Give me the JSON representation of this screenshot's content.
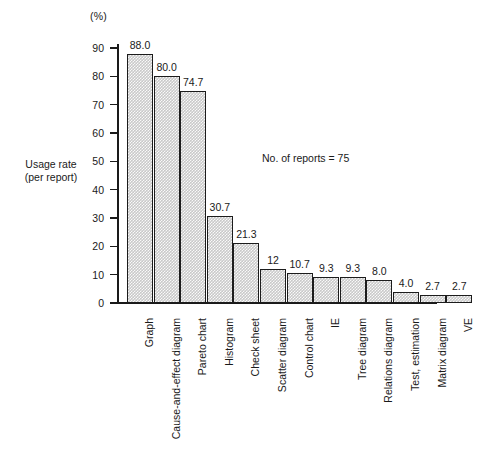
{
  "chart_data": {
    "type": "bar",
    "title": "",
    "subtitle": "",
    "xlabel": "",
    "ylabel": "Usage rate\n(per report)",
    "unit_label": "(%)",
    "annotation": "No. of reports = 75",
    "ylim": [
      0,
      90
    ],
    "ytick_values": [
      0,
      10,
      20,
      30,
      40,
      50,
      60,
      70,
      80,
      90
    ],
    "ytick_labels": [
      "0",
      "10",
      "20",
      "30",
      "40",
      "50",
      "60",
      "70",
      "80",
      "90"
    ],
    "grid": false,
    "legend": "none",
    "categories": [
      "Graph",
      "Cause-and-effect diagram",
      "Pareto chart",
      "Histogram",
      "Check sheet",
      "Scatter diagram",
      "Control chart",
      "IE",
      "Tree diagram",
      "Relations diagram",
      "Test, estimation",
      "Matrix diagram",
      "VE"
    ],
    "values": [
      88.0,
      80.0,
      74.7,
      30.7,
      21.3,
      12.0,
      10.7,
      9.3,
      9.3,
      8.0,
      4.0,
      2.7,
      2.7
    ],
    "value_labels": [
      "88.0",
      "80.0",
      "74.7",
      "30.7",
      "21.3",
      "12",
      "10.7",
      "9.3",
      "9.3",
      "8.0",
      "4.0",
      "2.7",
      "2.7"
    ],
    "bar_fill_color": "#c9c9c9",
    "bar_edge_color": "#1c1c1c",
    "axis_color": "#1a1a1a"
  }
}
